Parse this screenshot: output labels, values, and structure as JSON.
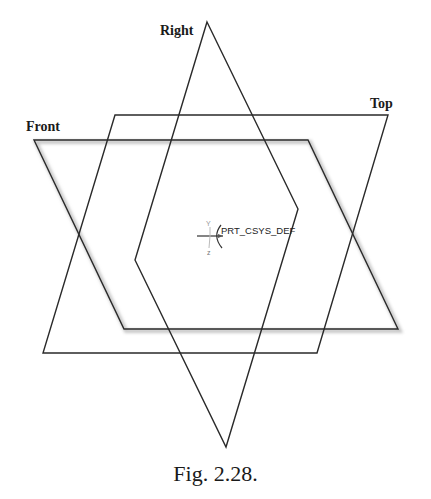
{
  "figure": {
    "caption": "Fig. 2.28.",
    "planes": [
      {
        "name": "Right",
        "label": "Right",
        "label_pos": [
          160,
          24
        ],
        "points": [
          [
            207,
            22
          ],
          [
            298,
            209
          ],
          [
            226,
            447
          ],
          [
            135,
            260
          ]
        ]
      },
      {
        "name": "Top",
        "label": "Top",
        "label_pos": [
          370,
          97
        ],
        "points": [
          [
            115,
            115
          ],
          [
            388,
            115
          ],
          [
            317,
            353
          ],
          [
            43,
            353
          ]
        ]
      },
      {
        "name": "Front",
        "label": "Front",
        "label_pos": [
          26,
          120
        ],
        "points": [
          [
            34,
            140
          ],
          [
            308,
            140
          ],
          [
            398,
            329
          ],
          [
            124,
            329
          ]
        ],
        "highlighted": true
      }
    ],
    "coordinate_system": {
      "label": "PRT_CSYS_DEF",
      "label_pos": [
        221,
        226
      ],
      "origin": [
        210,
        236
      ],
      "axis_labels": {
        "y": "Y",
        "z": "z",
        "x": "x"
      }
    },
    "colors": {
      "line": "#2a2a2a",
      "shadow": "#c8c8c8",
      "background": "#ffffff"
    }
  }
}
